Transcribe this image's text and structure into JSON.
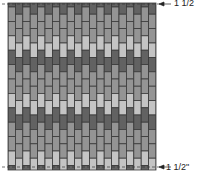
{
  "diagram": {
    "type": "brick-stitch-chart",
    "field": {
      "x": 8,
      "y": 3,
      "width": 148,
      "height": 167
    },
    "columns": 20,
    "brick_height": 14.4,
    "column_offset": 7.2,
    "color_sequence": [
      "medium",
      "medium",
      "light",
      "dark"
    ],
    "colors": {
      "light": "#c4c4c4",
      "medium": "#949494",
      "dark": "#626262",
      "outline": "#3a3a3a",
      "background": "#ffffff"
    },
    "markers": [
      {
        "name": "top-margin",
        "y": 4,
        "label": "1 1/2"
      },
      {
        "name": "bottom-margin",
        "y": 167,
        "label": "1 1/2\""
      }
    ]
  }
}
